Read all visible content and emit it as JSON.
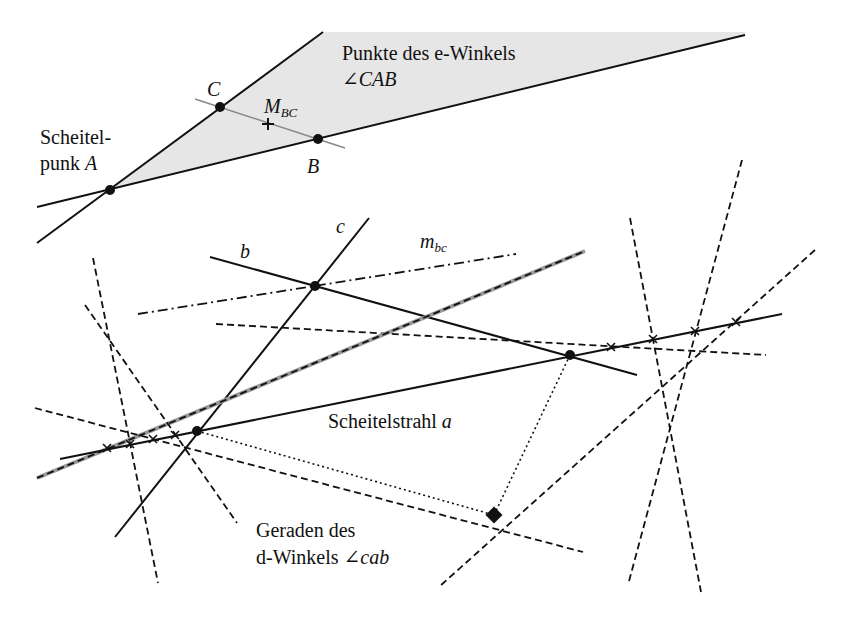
{
  "labels": {
    "region_title": "Punkte des e-Winkels",
    "region_angle": "∠CAB",
    "vertex_line1": "Scheitel-",
    "vertex_line2": "punk ",
    "vertex_A": "A",
    "point_C": "C",
    "point_B": "B",
    "midpoint_M": "M",
    "midpoint_sub": "BC",
    "line_b": "b",
    "line_c": "c",
    "perp_m": "m",
    "perp_sub": "bc",
    "ray_a_text": "Scheitelstrahl ",
    "ray_a": "a",
    "lines_text1": "Geraden des",
    "lines_text2": "d-Winkels ",
    "lines_angle": "∠cab"
  },
  "colors": {
    "ink": "#111111",
    "shade": "#e6e6e6",
    "gray_line": "#888888"
  },
  "geometry": {
    "shade_polygon": "110,190 323,32 745,32 745,35",
    "A": [
      110,
      190
    ],
    "B": [
      318,
      139
    ],
    "C": [
      220,
      107
    ],
    "M_BC": [
      268,
      124
    ],
    "vertex_lower": [
      197,
      431
    ],
    "point_bc": [
      315,
      286
    ],
    "point_ab": [
      570,
      355
    ],
    "diamond": [
      494,
      515
    ],
    "crosses": [
      [
        107,
        448
      ],
      [
        130,
        444
      ],
      [
        153,
        439
      ],
      [
        175,
        435
      ],
      [
        611,
        347
      ],
      [
        653,
        339
      ],
      [
        695,
        331
      ],
      [
        736,
        322
      ]
    ]
  }
}
